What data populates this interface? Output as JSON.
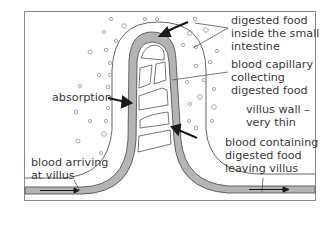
{
  "diagram": {
    "labels": {
      "digested_food": [
        "digested food",
        "inside the small",
        "intestine"
      ],
      "capillary": [
        "blood capillary",
        "collecting",
        "digested food"
      ],
      "absorption": "absorption",
      "villus_wall": [
        "villus wall –",
        "very thin"
      ],
      "blood_arriving": [
        "blood arriving",
        "at villus"
      ],
      "blood_leaving": [
        "blood containing",
        "digested food",
        "leaving villus"
      ]
    },
    "colors": {
      "frame": "#8a8a8a",
      "capillary_fill": "#b4b4b4",
      "outline": "#555555",
      "arrow": "#1a1a1a",
      "text": "#3a3a3a",
      "particle": "#a8a8a8"
    }
  }
}
